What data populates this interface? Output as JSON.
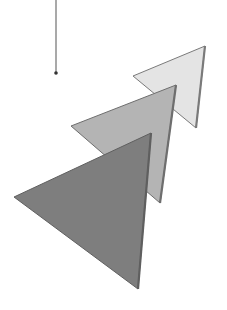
{
  "canvas": {
    "width": 227,
    "height": 310,
    "background": "#ffffff"
  },
  "pendant": {
    "line": {
      "x": 56,
      "y1": 0,
      "y2": 72,
      "color": "#707070",
      "width": 1.2
    },
    "dot": {
      "cx": 56,
      "cy": 73,
      "r": 1.8,
      "color": "#333333"
    }
  },
  "triangles": [
    {
      "name": "light",
      "points": "205,46 133,76 196,128",
      "fill": "#e4e4e4",
      "stroke": "#7a7a7a",
      "edge": "205,46 196,128"
    },
    {
      "name": "medium",
      "points": "176,85 71,126 160,203",
      "fill": "#b4b4b4",
      "stroke": "#6e6e6e",
      "edge": "176,85 160,203"
    },
    {
      "name": "dark",
      "points": "151,133 14,197 138,289",
      "fill": "#7e7e7e",
      "stroke": "#5f5f5f",
      "edge": "151,133 138,289"
    }
  ]
}
